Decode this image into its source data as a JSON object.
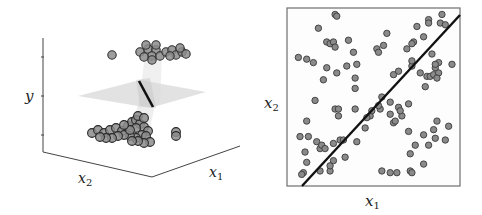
{
  "chart_data": [
    {
      "type": "scatter3d",
      "title": "",
      "xlabel": "x1",
      "ylabel": "x2",
      "zlabel": "y",
      "description": "3D view of binary labels y over (x1, x2) with a translucent separating plane; points cluster at y=1 (top) and y=0 (bottom)",
      "labels": {
        "x1": "x",
        "x1_sub": "1",
        "x2": "x",
        "x2_sub": "2",
        "y": "y"
      },
      "clusters": [
        {
          "name": "y_high",
          "screen_points": [
            [
              140,
              52
            ],
            [
              148,
              49
            ],
            [
              156,
              50
            ],
            [
              152,
              56
            ],
            [
              144,
              57
            ],
            [
              152,
              60
            ],
            [
              160,
              56
            ],
            [
              166,
              52
            ],
            [
              172,
              50
            ],
            [
              176,
              55
            ],
            [
              182,
              52
            ],
            [
              186,
              54
            ],
            [
              170,
              56
            ],
            [
              180,
              48
            ],
            [
              146,
              45
            ],
            [
              156,
              45
            ],
            [
              112,
              55
            ]
          ]
        },
        {
          "name": "y_low",
          "screen_points": [
            [
              92,
              133
            ],
            [
              98,
              130
            ],
            [
              104,
              133
            ],
            [
              110,
              130
            ],
            [
              116,
              128
            ],
            [
              122,
              131
            ],
            [
              128,
              126
            ],
            [
              132,
              122
            ],
            [
              136,
              120
            ],
            [
              140,
              124
            ],
            [
              144,
              127
            ],
            [
              148,
              131
            ],
            [
              142,
              135
            ],
            [
              136,
              138
            ],
            [
              130,
              136
            ],
            [
              124,
              135
            ],
            [
              118,
              136
            ],
            [
              112,
              138
            ],
            [
              106,
              138
            ],
            [
              100,
              137
            ],
            [
              136,
              128
            ],
            [
              130,
              130
            ],
            [
              124,
              125
            ],
            [
              138,
              116
            ],
            [
              144,
              118
            ],
            [
              146,
              136
            ],
            [
              150,
              142
            ],
            [
              144,
              143
            ],
            [
              138,
              141
            ],
            [
              132,
              141
            ],
            [
              176,
              132
            ],
            [
              176,
              136
            ]
          ]
        }
      ]
    },
    {
      "type": "scatter",
      "title": "",
      "xlabel": "x1",
      "ylabel": "x2",
      "labels": {
        "x1": "x",
        "x1_sub": "1",
        "x2": "x",
        "x2_sub": "2"
      },
      "grid": false,
      "decision_line": {
        "from": [
          0.0,
          0.0
        ],
        "to": [
          1.0,
          0.96
        ]
      },
      "points": [
        [
          0.17,
          0.9
        ],
        [
          0.27,
          0.98
        ],
        [
          0.28,
          0.97
        ],
        [
          0.22,
          0.82
        ],
        [
          0.24,
          0.81
        ],
        [
          0.26,
          0.82
        ],
        [
          0.27,
          0.79
        ],
        [
          0.35,
          0.83
        ],
        [
          0.05,
          0.73
        ],
        [
          0.1,
          0.72
        ],
        [
          0.14,
          0.7
        ],
        [
          0.22,
          0.67
        ],
        [
          0.28,
          0.64
        ],
        [
          0.34,
          0.68
        ],
        [
          0.4,
          0.69
        ],
        [
          0.38,
          0.76
        ],
        [
          0.52,
          0.78
        ],
        [
          0.53,
          0.76
        ],
        [
          0.56,
          0.8
        ],
        [
          0.58,
          0.87
        ],
        [
          0.2,
          0.6
        ],
        [
          0.39,
          0.61
        ],
        [
          0.39,
          0.55
        ],
        [
          0.15,
          0.48
        ],
        [
          0.27,
          0.43
        ],
        [
          0.29,
          0.43
        ],
        [
          0.39,
          0.43
        ],
        [
          0.29,
          0.39
        ],
        [
          0.1,
          0.36
        ],
        [
          0.06,
          0.27
        ],
        [
          0.11,
          0.27
        ],
        [
          0.16,
          0.24
        ],
        [
          0.18,
          0.2
        ],
        [
          0.19,
          0.22
        ],
        [
          0.21,
          0.2
        ],
        [
          0.26,
          0.23
        ],
        [
          0.3,
          0.25
        ],
        [
          0.32,
          0.25
        ],
        [
          0.4,
          0.24
        ],
        [
          0.09,
          0.18
        ],
        [
          0.1,
          0.12
        ],
        [
          0.08,
          0.06
        ],
        [
          0.07,
          0.05
        ],
        [
          0.18,
          0.07
        ],
        [
          0.24,
          0.07
        ],
        [
          0.24,
          0.1
        ],
        [
          0.26,
          0.13
        ],
        [
          0.33,
          0.15
        ],
        [
          0.48,
          0.39
        ],
        [
          0.49,
          0.42
        ],
        [
          0.54,
          0.43
        ],
        [
          0.46,
          0.38
        ],
        [
          0.45,
          0.32
        ],
        [
          0.55,
          0.5
        ],
        [
          0.53,
          0.45
        ],
        [
          0.6,
          0.47
        ],
        [
          0.6,
          0.4
        ],
        [
          0.65,
          0.44
        ],
        [
          0.67,
          0.39
        ],
        [
          0.66,
          0.42
        ],
        [
          0.71,
          0.46
        ],
        [
          0.62,
          0.35
        ],
        [
          0.63,
          0.36
        ],
        [
          0.62,
          0.63
        ],
        [
          0.65,
          0.65
        ],
        [
          0.73,
          0.68
        ],
        [
          0.7,
          0.78
        ],
        [
          0.73,
          0.71
        ],
        [
          0.74,
          0.82
        ],
        [
          0.76,
          0.91
        ],
        [
          0.8,
          0.85
        ],
        [
          0.83,
          0.95
        ],
        [
          0.83,
          0.93
        ],
        [
          0.91,
          0.98
        ],
        [
          0.9,
          0.93
        ],
        [
          0.93,
          0.92
        ],
        [
          0.78,
          0.64
        ],
        [
          0.81,
          0.56
        ],
        [
          0.82,
          0.62
        ],
        [
          0.84,
          0.62
        ],
        [
          0.86,
          0.63
        ],
        [
          0.87,
          0.67
        ],
        [
          0.89,
          0.64
        ],
        [
          0.89,
          0.7
        ],
        [
          0.88,
          0.61
        ],
        [
          0.87,
          0.69
        ],
        [
          0.97,
          0.69
        ],
        [
          0.85,
          0.75
        ],
        [
          0.73,
          0.81
        ],
        [
          0.71,
          0.3
        ],
        [
          0.75,
          0.22
        ],
        [
          0.72,
          0.17
        ],
        [
          0.8,
          0.11
        ],
        [
          0.86,
          0.31
        ],
        [
          0.88,
          0.36
        ],
        [
          0.87,
          0.26
        ],
        [
          0.93,
          0.25
        ],
        [
          0.95,
          0.33
        ],
        [
          0.55,
          0.07
        ],
        [
          0.6,
          0.06
        ],
        [
          0.64,
          0.06
        ],
        [
          0.72,
          0.07
        ],
        [
          0.73,
          0.06
        ],
        [
          0.83,
          0.22
        ],
        [
          0.8,
          0.28
        ]
      ]
    }
  ],
  "axes_labels": {
    "left_y": "y",
    "left_x2_main": "x",
    "left_x2_sub": "2",
    "left_x1_main": "x",
    "left_x1_sub": "1",
    "right_x2_main": "x",
    "right_x2_sub": "2",
    "right_x1_main": "x",
    "right_x1_sub": "1"
  },
  "colors": {
    "point_fill": "#8a8a8a",
    "point_stroke": "#3a3a3a",
    "line": "#111111",
    "plane": "#d9d9d9",
    "frame": "#666666"
  }
}
